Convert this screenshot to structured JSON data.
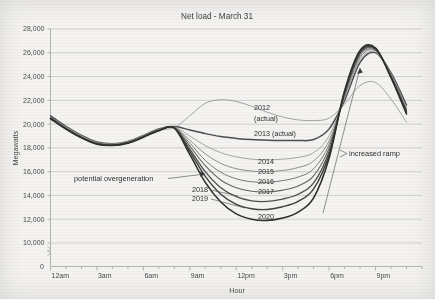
{
  "chart_data": {
    "type": "line",
    "title": "Net load - March 31",
    "xlabel": "Hour",
    "ylabel": "Megawatts",
    "grid": true,
    "legend_position": "inline-labels",
    "axis_break": true,
    "xlim": [
      0,
      24
    ],
    "ylim": [
      10000,
      28000
    ],
    "y_zero_label": "0",
    "yticks": [
      10000,
      12000,
      14000,
      16000,
      18000,
      20000,
      22000,
      24000,
      26000,
      28000
    ],
    "ytick_labels": [
      "10,000",
      "12,000",
      "14,000",
      "16,000",
      "18,000",
      "20,000",
      "22,000",
      "24,000",
      "26,000",
      "28,000"
    ],
    "xticks": [
      0,
      3,
      6,
      9,
      12,
      15,
      18,
      21
    ],
    "xtick_labels": [
      "12am",
      "3am",
      "6am",
      "9am",
      "12pm",
      "3pm",
      "6pm",
      "9pm"
    ],
    "x": [
      0,
      1,
      2,
      3,
      4,
      5,
      6,
      7,
      8,
      9,
      10,
      11,
      12,
      13,
      14,
      15,
      16,
      17,
      18,
      19,
      20,
      21,
      22,
      23
    ],
    "series": [
      {
        "name": "2012 (actual)",
        "label": "2012",
        "label2": "(actual)",
        "color": "#9a9a98",
        "width": 0.9,
        "values": [
          20500,
          19700,
          19000,
          18450,
          18300,
          18500,
          19000,
          19500,
          19700,
          20700,
          21750,
          22050,
          21900,
          21500,
          21000,
          20600,
          20350,
          20300,
          20500,
          21700,
          23250,
          23500,
          22100,
          20150
        ]
      },
      {
        "name": "2013 (actual)",
        "label": "2013 (actual)",
        "color": "#4d4d4d",
        "width": 1.5,
        "values": [
          20700,
          19800,
          19050,
          18500,
          18350,
          18550,
          19050,
          19600,
          19800,
          19500,
          19200,
          18950,
          18800,
          18700,
          18650,
          18620,
          18620,
          18700,
          19600,
          22000,
          25200,
          26000,
          24300,
          21600
        ]
      },
      {
        "name": "2014",
        "label": "2014",
        "color": "#a5a5a3",
        "width": 1.0,
        "values": [
          20600,
          19750,
          19000,
          18450,
          18320,
          18520,
          19020,
          19560,
          19750,
          19000,
          18200,
          17600,
          17250,
          17050,
          17000,
          17050,
          17200,
          17600,
          19000,
          22200,
          25400,
          26050,
          24200,
          21400
        ]
      },
      {
        "name": "2015",
        "label": "2015",
        "color": "#8e8e8c",
        "width": 1.0,
        "values": [
          20600,
          19700,
          18950,
          18420,
          18300,
          18500,
          19000,
          19540,
          19730,
          18650,
          17500,
          16700,
          16250,
          16050,
          16000,
          16100,
          16350,
          16900,
          18600,
          22300,
          25600,
          26150,
          24150,
          21300
        ]
      },
      {
        "name": "2016",
        "label": "2016",
        "color": "#7a7a78",
        "width": 1.0,
        "values": [
          20550,
          19680,
          18930,
          18400,
          18280,
          18480,
          18980,
          19520,
          19720,
          18400,
          16950,
          15950,
          15400,
          15150,
          15100,
          15250,
          15550,
          16250,
          18300,
          22400,
          25750,
          26200,
          24100,
          21250
        ]
      },
      {
        "name": "2017",
        "label": "2017",
        "color": "#656563",
        "width": 1.1,
        "values": [
          20550,
          19650,
          18900,
          18380,
          18260,
          18460,
          18960,
          19500,
          19700,
          18150,
          16500,
          15300,
          14650,
          14350,
          14300,
          14450,
          14800,
          15650,
          18000,
          22500,
          25900,
          26250,
          24050,
          21150
        ]
      },
      {
        "name": "2018",
        "label": "2018",
        "color": "#4f4f4d",
        "width": 1.3,
        "values": [
          20500,
          19620,
          18880,
          18350,
          18240,
          18440,
          18940,
          19480,
          19690,
          17900,
          16000,
          14650,
          13900,
          13550,
          13500,
          13700,
          14100,
          15050,
          17700,
          22600,
          26000,
          26300,
          24000,
          21050
        ]
      },
      {
        "name": "2019",
        "label": "2019",
        "color": "#3f3f3d",
        "width": 1.4,
        "values": [
          20500,
          19600,
          18860,
          18330,
          18220,
          18420,
          18920,
          19460,
          19680,
          17700,
          15600,
          14100,
          13250,
          12880,
          12820,
          13050,
          13500,
          14550,
          17450,
          22700,
          26100,
          26350,
          23950,
          20950
        ]
      },
      {
        "name": "2020",
        "label": "2020",
        "color": "#2e2e2c",
        "width": 1.6,
        "values": [
          20450,
          19580,
          18840,
          18310,
          18200,
          18400,
          18900,
          19450,
          19670,
          17450,
          15100,
          13450,
          12450,
          12000,
          11900,
          12100,
          12600,
          13800,
          17150,
          22800,
          26200,
          26400,
          23900,
          20850
        ]
      }
    ],
    "annotations": [
      {
        "name": "potential-overgeneration",
        "text": "potential overgeneration",
        "type": "arrow-label"
      },
      {
        "name": "increased-ramp",
        "text": "increased ramp",
        "type": "arrow-label"
      }
    ]
  }
}
